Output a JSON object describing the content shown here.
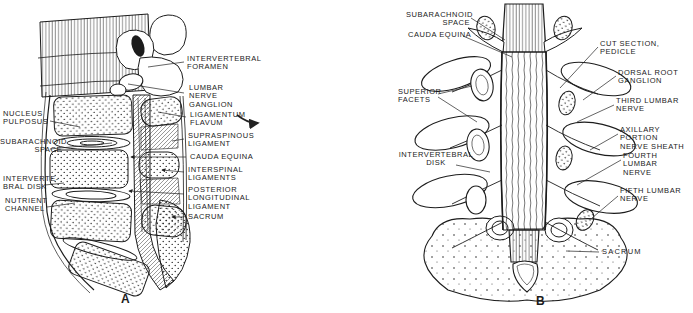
{
  "figure": {
    "ink_color": "#1c1c1c",
    "background": "#ffffff",
    "panel_a": {
      "letter": "A",
      "view": "sagittal-section",
      "labels_left": [
        {
          "id": "nucleus-pulposus",
          "text": "NUCLEUS\nPULPOSUS"
        },
        {
          "id": "subarachnoid-space",
          "text": "SUBARACHNOID\nSPACE"
        },
        {
          "id": "intervertebral-disk",
          "text": "INTERVERTE-\nBRAL DISK"
        },
        {
          "id": "nutrient-channel",
          "text": "NUTRIENT\nCHANNEL"
        }
      ],
      "labels_right": [
        {
          "id": "intervertebral-foramen",
          "text": "INTERVERTEBRAL\nFORAMEN"
        },
        {
          "id": "lumbar-nerve-ganglion",
          "text": "LUMBAR\nNERVE\nGANGLION"
        },
        {
          "id": "ligamentum-flavum",
          "text": "LIGAMENTUM\nFLAVUM"
        },
        {
          "id": "supraspinous-ligament",
          "text": "SUPRASPINOUS\nLIGAMENT"
        },
        {
          "id": "cauda-equina",
          "text": "CAUDA EQUINA"
        },
        {
          "id": "interspinal-ligaments",
          "text": "INTERSPINAL\nLIGAMENTS"
        },
        {
          "id": "posterior-longitudinal-ligament",
          "text": "POSTERIOR\nLONGITUDINAL\nLIGAMENT"
        },
        {
          "id": "sacrum",
          "text": "SACRUM"
        }
      ]
    },
    "panel_b": {
      "letter": "B",
      "view": "posterior-view-laminae-removed",
      "labels_left": [
        {
          "id": "subarachnoid-space",
          "text": "SUBARACHNOID\nSPACE"
        },
        {
          "id": "cauda-equina",
          "text": "CAUDA EQUINA"
        },
        {
          "id": "superior-facets",
          "text": "SUPERIOR\nFACETS"
        },
        {
          "id": "intervertebral-disk",
          "text": "INTERVERTEBRAL\nDISK"
        }
      ],
      "labels_right": [
        {
          "id": "cut-section-pedicle",
          "text": "CUT SECTION, PEDICLE"
        },
        {
          "id": "dorsal-root-ganglion",
          "text": "DORSAL ROOT\nGANGLION"
        },
        {
          "id": "third-lumbar-nerve",
          "text": "THIRD LUMBAR\nNERVE"
        },
        {
          "id": "axillary-portion-nerve-sheath",
          "text": "AXILLARY PORTION\nNERVE SHEATH"
        },
        {
          "id": "fourth-lumbar-nerve",
          "text": "FOURTH LUMBAR\nNERVE"
        },
        {
          "id": "fifth-lumbar-nerve",
          "text": "FIFTH LUMBAR\nNERVE"
        },
        {
          "id": "sacrum",
          "text": "SACRUM"
        }
      ]
    }
  }
}
